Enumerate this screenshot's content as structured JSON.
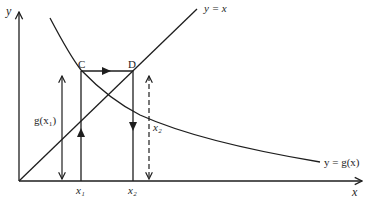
{
  "diagram": {
    "axes": {
      "x_label": "x",
      "y_label": "y"
    },
    "curves": {
      "identity_label": "y = x",
      "function_label": "y = g(x)"
    },
    "points": {
      "c_label": "C",
      "d_label": "D"
    },
    "ticks": {
      "x1_label": "x₁",
      "x2_label": "x₂"
    },
    "annotations": {
      "g_x1_label": "g(x₁)",
      "x2_height_label": "x₂"
    },
    "colors": {
      "ink": "#1e1e1e",
      "background": "#ffffff"
    }
  }
}
